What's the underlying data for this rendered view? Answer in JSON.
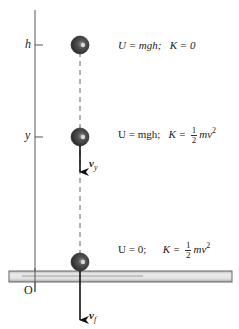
{
  "diagram": {
    "axis_labels": {
      "top": "h",
      "middle": "y",
      "origin": "O"
    },
    "states": [
      {
        "position": "h",
        "U": "U = mgh;",
        "K_prefix": "K = ",
        "K_value": "0",
        "K_frac": null
      },
      {
        "position": "y",
        "U": "U = mgh;",
        "K_prefix": "K = ",
        "K_frac": {
          "num": "1",
          "den": "2"
        },
        "K_tail": "mv",
        "K_exp": "2"
      },
      {
        "position": "0",
        "U": "U = 0;",
        "K_prefix": "K = ",
        "K_frac": {
          "num": "1",
          "den": "2"
        },
        "K_tail": "mv",
        "K_exp": "2"
      }
    ],
    "velocity_labels": {
      "middle": {
        "base": "v",
        "sub": "y"
      },
      "bottom": {
        "base": "v",
        "sub": "f"
      }
    },
    "colors": {
      "ball": "#3a3a3a",
      "axis": "#555555",
      "ground_fill": "#d9d9d9",
      "ground_stroke": "#666666",
      "arrow": "#111111"
    }
  }
}
